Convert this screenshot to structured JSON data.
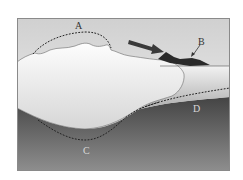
{
  "diagram": {
    "type": "glacier-cross-section",
    "labels": {
      "A": "A",
      "B": "B",
      "C": "C",
      "D": "D"
    },
    "colors": {
      "frame_border": "#8a8a8a",
      "sky_top": "#d2d2d2",
      "sky_bottom": "#f4f4f4",
      "ice_top": "#fbfbfb",
      "ice_bottom": "#d8d8d8",
      "water_top": "#f0f0f0",
      "water_bottom": "#b4b4b4",
      "bedrock_top": "#4a4a4a",
      "bedrock_bottom": "#8c8c8c",
      "arrow": "#3a3a3a",
      "deposit": "#2b2b2b",
      "dashed_line": "#222222",
      "outline": "#555555",
      "label_dark": "#333333",
      "label_light": "#d8d8d8"
    }
  }
}
